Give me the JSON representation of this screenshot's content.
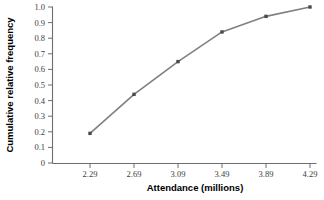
{
  "chart_data": {
    "type": "line",
    "title": "",
    "xlabel": "Attendance (millions)",
    "ylabel": "Cumulative relative frequency",
    "x": [
      2.29,
      2.69,
      3.09,
      3.49,
      3.89,
      4.29
    ],
    "values": [
      0.19,
      0.44,
      0.65,
      0.84,
      0.94,
      1.0
    ],
    "xticklabels": [
      "2.29",
      "2.69",
      "3.09",
      "3.49",
      "3.89",
      "4.29"
    ],
    "yticklabels": [
      "1.0",
      "0.9",
      "0.8",
      "0.7",
      "0.6",
      "0.5",
      "0.4",
      "0.3",
      "0.2",
      "0.1",
      "0"
    ],
    "yticks": [
      1.0,
      0.9,
      0.8,
      0.7,
      0.6,
      0.5,
      0.4,
      0.3,
      0.2,
      0.1,
      0
    ],
    "xlim": [
      2.19,
      4.34
    ],
    "ylim": [
      0,
      1.0
    ],
    "grid": false,
    "legend": null,
    "series_color": "#808080",
    "marker_color": "#4a4a4a",
    "marker": "square",
    "axis_color": "#6e6e6e"
  }
}
